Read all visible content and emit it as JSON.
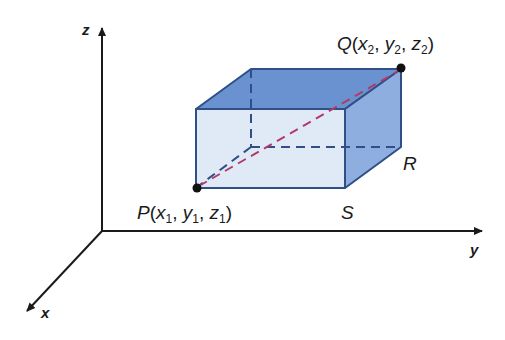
{
  "diagram": {
    "axes": {
      "x": {
        "label": "x"
      },
      "y": {
        "label": "y"
      },
      "z": {
        "label": "z"
      }
    },
    "points": {
      "P": {
        "name": "P",
        "coords": "(x1, y1, z1)",
        "x_sub": "1",
        "y_sub": "1",
        "z_sub": "1"
      },
      "Q": {
        "name": "Q",
        "coords": "(x2, y2, z2)",
        "x_sub": "2",
        "y_sub": "2",
        "z_sub": "2"
      },
      "R": {
        "name": "R"
      },
      "S": {
        "name": "S"
      }
    },
    "colors": {
      "axis": "#1a1a1a",
      "box_edge": "#2f4f86",
      "top_face": "#6a92d0",
      "front_face": "#dde8f6",
      "side_face": "#8eaee0",
      "diagonal": "#b03a6a",
      "hidden_edge": "#2f4f86"
    }
  }
}
